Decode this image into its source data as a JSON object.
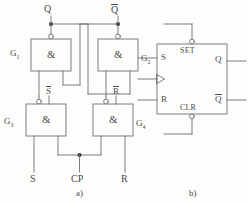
{
  "figure": {
    "stroke_color": "#6e6e6e",
    "text_color": "#4a4a4a",
    "background": "#fdfdfc"
  },
  "diagram_a": {
    "caption": "a)",
    "outputs": [
      {
        "name": "Q",
        "label": "Q",
        "overbar": false
      },
      {
        "name": "Qn",
        "label": "Q",
        "overbar": true
      }
    ],
    "gates": [
      {
        "id": "G1",
        "label": "G",
        "sub": "1",
        "symbol": "&",
        "type": "nand",
        "top_pin": "",
        "top_pin_overbar": false
      },
      {
        "id": "G2",
        "label": "G",
        "sub": "2",
        "symbol": "&",
        "type": "nand",
        "top_pin": "",
        "top_pin_overbar": false
      },
      {
        "id": "G3",
        "label": "G",
        "sub": "3",
        "symbol": "&",
        "type": "nand",
        "top_pin": "S",
        "top_pin_overbar": true
      },
      {
        "id": "G4",
        "label": "G",
        "sub": "4",
        "symbol": "&",
        "type": "nand",
        "top_pin": "R",
        "top_pin_overbar": true
      }
    ],
    "inputs": [
      {
        "name": "S",
        "label": "S"
      },
      {
        "name": "CP",
        "label": "CP"
      },
      {
        "name": "R",
        "label": "R"
      }
    ]
  },
  "diagram_b": {
    "caption": "b)",
    "pins_left": [
      {
        "name": "S",
        "label": "S"
      },
      {
        "name": "clock",
        "label": "",
        "icon": "clock-triangle-icon"
      },
      {
        "name": "R",
        "label": "R"
      }
    ],
    "pins_right": [
      {
        "name": "Q",
        "label": "Q",
        "overbar": false
      },
      {
        "name": "Qn",
        "label": "Q",
        "overbar": true
      }
    ],
    "pin_top": {
      "name": "SET",
      "label": "SET",
      "active_low": true
    },
    "pin_bottom": {
      "name": "CLR",
      "label": "CLR",
      "active_low": true
    }
  }
}
